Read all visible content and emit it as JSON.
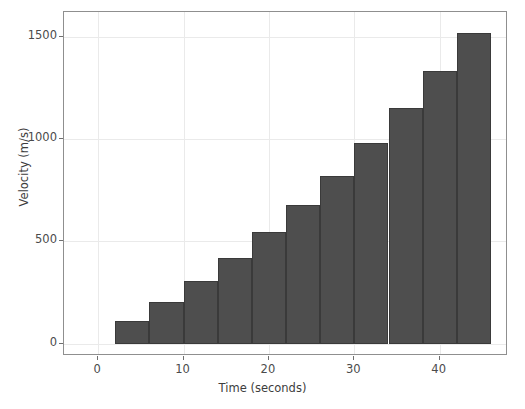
{
  "chart_data": {
    "type": "bar",
    "title": "",
    "xlabel": "Time (seconds)",
    "ylabel": "Velocity (m/s)",
    "xlim": [
      -4,
      48
    ],
    "ylim": [
      -60,
      1620
    ],
    "grid": true,
    "legend": "none",
    "bar_color": "#4e4e4e",
    "bar_edge_color": "#3a3a3a",
    "bin_width": 4,
    "x_tick_labels": [
      "0",
      "10",
      "20",
      "30",
      "40"
    ],
    "x_ticks": [
      0,
      10,
      20,
      30,
      40
    ],
    "y_tick_labels": [
      "0",
      "500",
      "1000",
      "1500"
    ],
    "y_ticks": [
      0,
      500,
      1000,
      1500
    ],
    "bin_edges": [
      2,
      6,
      10,
      14,
      18,
      22,
      26,
      30,
      34,
      38,
      42,
      46
    ],
    "categories": [
      "2-6",
      "6-10",
      "10-14",
      "14-18",
      "18-22",
      "22-26",
      "26-30",
      "30-34",
      "34-38",
      "38-42",
      "42-46"
    ],
    "x": [
      4,
      8,
      12,
      16,
      20,
      24,
      28,
      32,
      36,
      40,
      44
    ],
    "values": [
      110,
      205,
      305,
      420,
      545,
      680,
      820,
      980,
      1150,
      1330,
      1520
    ]
  }
}
